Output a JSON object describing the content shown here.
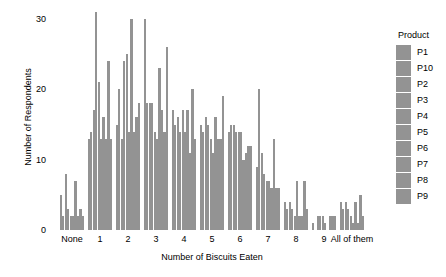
{
  "chart_data": {
    "type": "bar",
    "title": "",
    "xlabel": "Number of Biscuits Eaten",
    "ylabel": "Number of Respondents",
    "categories": [
      "None",
      "1",
      "2",
      "3",
      "4",
      "5",
      "6",
      "7",
      "8",
      "9",
      "All of them"
    ],
    "ylim": [
      0,
      31
    ],
    "yticks": [
      0,
      10,
      20,
      30
    ],
    "ytick_labels": [
      "0",
      "10",
      "20",
      "30"
    ],
    "grid": false,
    "legend": {
      "title": "Product",
      "position": "right",
      "entries": [
        "P1",
        "P10",
        "P2",
        "P3",
        "P4",
        "P5",
        "P6",
        "P7",
        "P8",
        "P9"
      ]
    },
    "bar_color": "#939393",
    "series": [
      {
        "name": "P1",
        "values": [
          5,
          13,
          15,
          30,
          17,
          15,
          14,
          9,
          4,
          1,
          4
        ]
      },
      {
        "name": "P10",
        "values": [
          2,
          14,
          20,
          18,
          15,
          14,
          15,
          20,
          3,
          0,
          3
        ]
      },
      {
        "name": "P2",
        "values": [
          8,
          17,
          13,
          18,
          16,
          16,
          15,
          11,
          4,
          2,
          4
        ]
      },
      {
        "name": "P3",
        "values": [
          3,
          31,
          24,
          18,
          14,
          15,
          14,
          8,
          3,
          2,
          3
        ]
      },
      {
        "name": "P4",
        "values": [
          2,
          21,
          25,
          14,
          17,
          13,
          14,
          7,
          2,
          2,
          2
        ]
      },
      {
        "name": "P5",
        "values": [
          2,
          13,
          14,
          13,
          14,
          11,
          14,
          7,
          7,
          1,
          1
        ]
      },
      {
        "name": "P6",
        "values": [
          7,
          16,
          30,
          23,
          17,
          16,
          10,
          6,
          2,
          0,
          4
        ]
      },
      {
        "name": "P7",
        "values": [
          2,
          13,
          14,
          17,
          11,
          13,
          11,
          13,
          2,
          2,
          1
        ]
      },
      {
        "name": "P8",
        "values": [
          3,
          24,
          16,
          14,
          20,
          13,
          12,
          6,
          7,
          2,
          5
        ]
      },
      {
        "name": "P9",
        "values": [
          2,
          13,
          18,
          26,
          13,
          19,
          12,
          6,
          3,
          2,
          2
        ]
      }
    ]
  }
}
